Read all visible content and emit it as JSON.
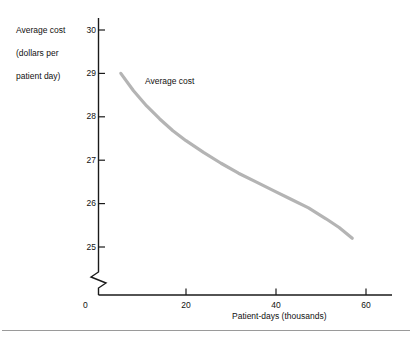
{
  "chart_data": {
    "type": "line",
    "title": "",
    "subtitle": "",
    "xlabel": "Patient-days (thousands)",
    "ylabel": "Average cost\n(dollars per\npatient day)",
    "xlim": [
      0,
      65
    ],
    "ylim": [
      25,
      30
    ],
    "xticks": [
      0,
      20,
      40,
      60
    ],
    "xtick_labels": [
      "0",
      "20",
      "40",
      "60"
    ],
    "yticks": [
      25,
      26,
      27,
      28,
      29,
      30
    ],
    "ytick_labels": [
      "25",
      "26",
      "27",
      "28",
      "29",
      "30"
    ],
    "grid": false,
    "legend": "none",
    "y_axis_break": true,
    "annotations": [
      {
        "text": "Average cost",
        "x": 12,
        "y": 28.9
      }
    ],
    "series": [
      {
        "name": "Average cost",
        "color": "#b4b4b4",
        "x": [
          5.1,
          8,
          11,
          14,
          17,
          20,
          24,
          28,
          32,
          36,
          40,
          44,
          48,
          52,
          55,
          58
        ],
        "values": [
          29.0,
          28.6,
          28.25,
          27.95,
          27.68,
          27.45,
          27.18,
          26.93,
          26.7,
          26.5,
          26.3,
          26.1,
          25.9,
          25.65,
          25.45,
          25.2
        ]
      }
    ]
  },
  "axis": {
    "x_title": "Patient-days (thousands)",
    "y_title_line1": "Average cost",
    "y_title_line2": "(dollars per",
    "y_title_line3": "patient day)",
    "origin_label": "0",
    "y_labels": [
      "30",
      "29",
      "28",
      "27",
      "26",
      "25"
    ],
    "x_labels": [
      "20",
      "40",
      "60"
    ]
  },
  "curve": {
    "label": "Average cost"
  },
  "colors": {
    "curve": "#b4b4b4",
    "axis": "#1a1a1a",
    "rule": "#9a9a9a"
  }
}
